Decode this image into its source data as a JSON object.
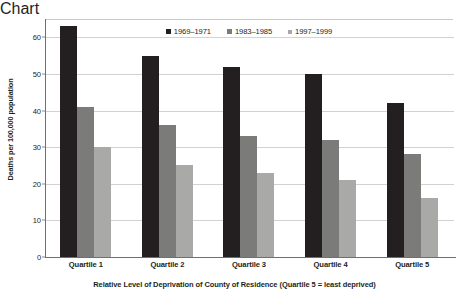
{
  "chart_data": {
    "type": "bar",
    "title": "",
    "subtitle": "",
    "xlabel": "Relative Level of Deprivation of County of Residence (Quartile 5 = least deprived)",
    "ylabel": "Deaths per 100,000 population",
    "categories": [
      "Quartile 1",
      "Quartile 2",
      "Quartile 3",
      "Quartile 4",
      "Quartile 5"
    ],
    "series": [
      {
        "name": "1969–1971",
        "color": "#231f20",
        "values": [
          63,
          55,
          52,
          50,
          42
        ]
      },
      {
        "name": "1983–1985",
        "color": "#7b7b79",
        "values": [
          41,
          36,
          33,
          32,
          28
        ]
      },
      {
        "name": "1997–1999",
        "color": "#a9a9a7",
        "values": [
          30,
          25,
          23,
          21,
          16
        ]
      }
    ],
    "ylim": [
      0,
      65
    ],
    "yticks": [
      0,
      10,
      20,
      30,
      40,
      50,
      60
    ],
    "ytick_labels": [
      "0",
      "10",
      "20",
      "30",
      "40",
      "50",
      "60"
    ],
    "grid": "horizontal",
    "legend_position": "top-center"
  },
  "legend": {
    "items": [
      {
        "label": "1969–1971",
        "swatch": "legend-swatch-dark"
      },
      {
        "label": "1983–1985",
        "swatch": "legend-swatch-medium"
      },
      {
        "label": "1997–1999",
        "swatch": "legend-swatch-light"
      }
    ]
  },
  "colors": {
    "series_1": "#231f20",
    "series_2": "#7b7b79",
    "series_3": "#a9a9a7",
    "gridline": "#d2d2d2",
    "axis": "#6f6f6f",
    "text": "#231f20",
    "background": "#ffffff"
  }
}
